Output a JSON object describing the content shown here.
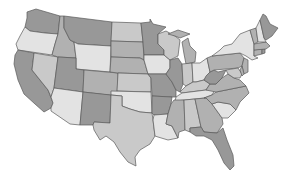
{
  "map": {
    "title": "United States choropleth (grayscale)",
    "palette": {
      "light": "#e3e3e3",
      "light_mid": "#c9c9c9",
      "mid": "#b1b1b1",
      "mid_dark": "#989898",
      "outline": "#5a5a5a",
      "background": "#ffffff"
    },
    "states": [
      {
        "id": "WA",
        "shade": "mid_dark"
      },
      {
        "id": "OR",
        "shade": "light"
      },
      {
        "id": "CA",
        "shade": "mid_dark"
      },
      {
        "id": "NV",
        "shade": "light_mid"
      },
      {
        "id": "ID",
        "shade": "mid"
      },
      {
        "id": "MT",
        "shade": "mid_dark"
      },
      {
        "id": "WY",
        "shade": "light"
      },
      {
        "id": "UT",
        "shade": "mid_dark"
      },
      {
        "id": "AZ",
        "shade": "light"
      },
      {
        "id": "CO",
        "shade": "mid"
      },
      {
        "id": "NM",
        "shade": "mid_dark"
      },
      {
        "id": "ND",
        "shade": "light_mid"
      },
      {
        "id": "SD",
        "shade": "mid"
      },
      {
        "id": "NE",
        "shade": "mid"
      },
      {
        "id": "KS",
        "shade": "light_mid"
      },
      {
        "id": "OK",
        "shade": "light"
      },
      {
        "id": "TX",
        "shade": "light_mid"
      },
      {
        "id": "MN",
        "shade": "mid_dark"
      },
      {
        "id": "IA",
        "shade": "light"
      },
      {
        "id": "MO",
        "shade": "mid_dark"
      },
      {
        "id": "AR",
        "shade": "mid_dark"
      },
      {
        "id": "LA",
        "shade": "light"
      },
      {
        "id": "WI",
        "shade": "light_mid"
      },
      {
        "id": "IL",
        "shade": "mid_dark"
      },
      {
        "id": "MI",
        "shade": "mid"
      },
      {
        "id": "IN",
        "shade": "light_mid"
      },
      {
        "id": "OH",
        "shade": "light"
      },
      {
        "id": "KY",
        "shade": "light_mid"
      },
      {
        "id": "TN",
        "shade": "light"
      },
      {
        "id": "MS",
        "shade": "mid"
      },
      {
        "id": "AL",
        "shade": "light_mid"
      },
      {
        "id": "GA",
        "shade": "mid"
      },
      {
        "id": "FL",
        "shade": "mid_dark"
      },
      {
        "id": "SC",
        "shade": "light"
      },
      {
        "id": "NC",
        "shade": "mid"
      },
      {
        "id": "VA",
        "shade": "mid"
      },
      {
        "id": "WV",
        "shade": "mid_dark"
      },
      {
        "id": "PA",
        "shade": "mid"
      },
      {
        "id": "NY",
        "shade": "light"
      },
      {
        "id": "NJ",
        "shade": "mid"
      },
      {
        "id": "MD",
        "shade": "light_mid"
      },
      {
        "id": "DE",
        "shade": "mid"
      },
      {
        "id": "CT",
        "shade": "mid"
      },
      {
        "id": "RI",
        "shade": "mid_dark"
      },
      {
        "id": "MA",
        "shade": "mid"
      },
      {
        "id": "VT",
        "shade": "mid"
      },
      {
        "id": "NH",
        "shade": "light"
      },
      {
        "id": "ME",
        "shade": "mid_dark"
      }
    ]
  }
}
